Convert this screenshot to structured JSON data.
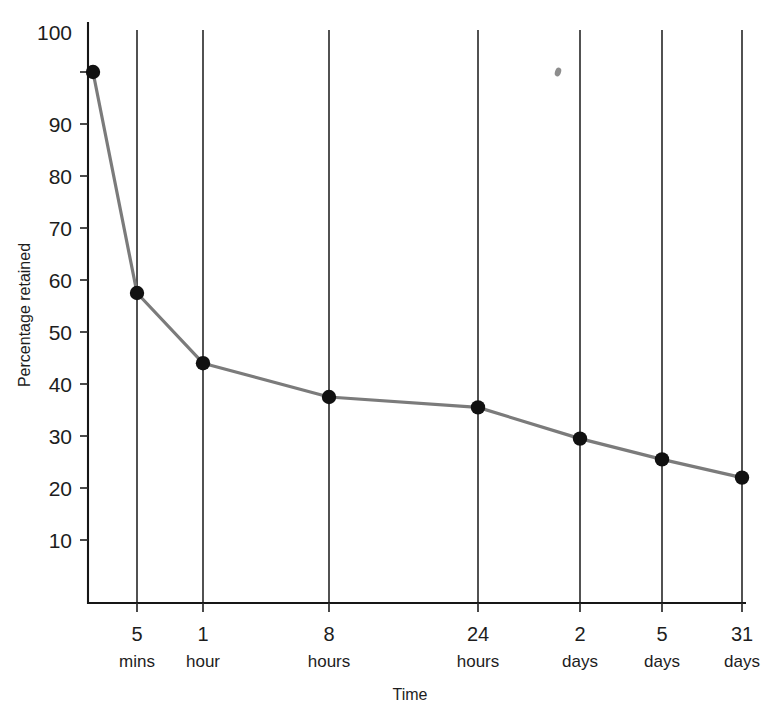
{
  "chart_data": {
    "type": "line",
    "title": "",
    "subtitle": "",
    "xlabel": "Time",
    "ylabel": "Percentage retained",
    "grid": "vertical gridlines at each category",
    "legend": "none",
    "ylim": [
      0,
      100
    ],
    "ytick_labels": [
      "10",
      "20",
      "30",
      "40",
      "50",
      "60",
      "70",
      "80",
      "90",
      "100"
    ],
    "ytick_values": [
      10,
      20,
      30,
      40,
      50,
      60,
      70,
      80,
      90,
      100
    ],
    "categories": [
      "",
      "5 mins",
      "1 hour",
      "8 hours",
      "24 hours",
      "2 days",
      "5 days",
      "31 days"
    ],
    "xtick_labels": [
      {
        "num": "5",
        "unit": "mins"
      },
      {
        "num": "1",
        "unit": "hour"
      },
      {
        "num": "8",
        "unit": "hours"
      },
      {
        "num": "24",
        "unit": "hours"
      },
      {
        "num": "2",
        "unit": "days"
      },
      {
        "num": "5",
        "unit": "days"
      },
      {
        "num": "31",
        "unit": "days"
      }
    ],
    "series": [
      {
        "name": "Percentage retained",
        "values": [
          100,
          57.5,
          44,
          37.5,
          35.5,
          29.5,
          25.5,
          22
        ],
        "points": [
          {
            "label": "immediate",
            "x_px": 93,
            "value": 100
          },
          {
            "label": "5 mins",
            "x_px": 137,
            "value": 57.5
          },
          {
            "label": "1 hour",
            "x_px": 203,
            "value": 44
          },
          {
            "label": "8 hours",
            "x_px": 329,
            "value": 37.5
          },
          {
            "label": "24 hours",
            "x_px": 478,
            "value": 35.5
          },
          {
            "label": "2 days",
            "x_px": 580,
            "value": 29.5
          },
          {
            "label": "5 days",
            "x_px": 662,
            "value": 25.5
          },
          {
            "label": "31 days",
            "x_px": 742,
            "value": 22
          }
        ],
        "line_color": "#7b7b7b",
        "marker_color": "#111111"
      }
    ]
  },
  "style": {
    "background": "#ffffff",
    "axis_color": "#161616",
    "grid_color": "#262626",
    "line_color": "#7b7b7b",
    "marker_color": "#111111",
    "text_color": "#1d1d1d"
  },
  "artifact": {
    "name": "scan-speck",
    "x": 558,
    "y": 72
  }
}
